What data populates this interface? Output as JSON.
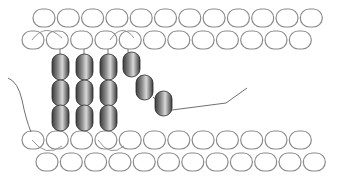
{
  "diagram": {
    "type": "membrane-protein-schematic",
    "colors": {
      "background": "#ffffff",
      "lipid_head_stroke": "#8a8a8a",
      "lipid_head_fill": "#ffffff",
      "helix_dark": "#3a3a3a",
      "helix_mid": "#8c8c8c",
      "helix_light": "#d8d8d8",
      "line": "#707070"
    },
    "lipid_rows": [
      {
        "name": "outer-top",
        "y": 9,
        "x_start": 33,
        "count": 12,
        "spacing": 24.3,
        "w": 22,
        "h": 18
      },
      {
        "name": "inner-top",
        "y": 31,
        "x_start": 22,
        "count": 12,
        "spacing": 24.3,
        "w": 22,
        "h": 18
      },
      {
        "name": "inner-bottom",
        "y": 131,
        "x_start": 22,
        "count": 12,
        "spacing": 24.3,
        "w": 22,
        "h": 18
      },
      {
        "name": "outer-bottom",
        "y": 153,
        "x_start": 36,
        "count": 12,
        "spacing": 24.3,
        "w": 22,
        "h": 18
      }
    ],
    "helices": [
      {
        "x": 52,
        "y": 54,
        "w": 17,
        "h": 26
      },
      {
        "x": 52,
        "y": 80,
        "w": 17,
        "h": 26
      },
      {
        "x": 52,
        "y": 105,
        "w": 17,
        "h": 26
      },
      {
        "x": 76,
        "y": 54,
        "w": 17,
        "h": 26
      },
      {
        "x": 76,
        "y": 80,
        "w": 17,
        "h": 26
      },
      {
        "x": 76,
        "y": 105,
        "w": 17,
        "h": 26
      },
      {
        "x": 100,
        "y": 54,
        "w": 17,
        "h": 26
      },
      {
        "x": 100,
        "y": 80,
        "w": 17,
        "h": 26
      },
      {
        "x": 100,
        "y": 105,
        "w": 17,
        "h": 26
      },
      {
        "x": 123,
        "y": 52,
        "w": 17,
        "h": 25
      },
      {
        "x": 136,
        "y": 75,
        "w": 17,
        "h": 25
      },
      {
        "x": 155,
        "y": 91,
        "w": 17,
        "h": 25
      }
    ],
    "connectors": [
      "M60,49 L60,54",
      "M84,49 L84,54",
      "M108,49 L108,54",
      "M128,49 L128,52",
      "M60,131 L60,131",
      "M84,131 L84,131",
      "M108,131 L108,131",
      "M140,76 L142,76",
      "M153,97 L157,100"
    ],
    "arches": [
      "M32,40 Q45,22 62,38",
      "M110,40 Q122,22 134,38",
      "M32,140 Q46,158 62,146",
      "M98,140 Q110,158 124,146"
    ],
    "tails": [
      {
        "name": "c-terminal-tail",
        "path": "M172,110 L226,103 L247,88"
      },
      {
        "name": "n-terminal-tail",
        "path": "M8,78 Q18,82 22,100 Q26,120 31,132"
      }
    ]
  }
}
